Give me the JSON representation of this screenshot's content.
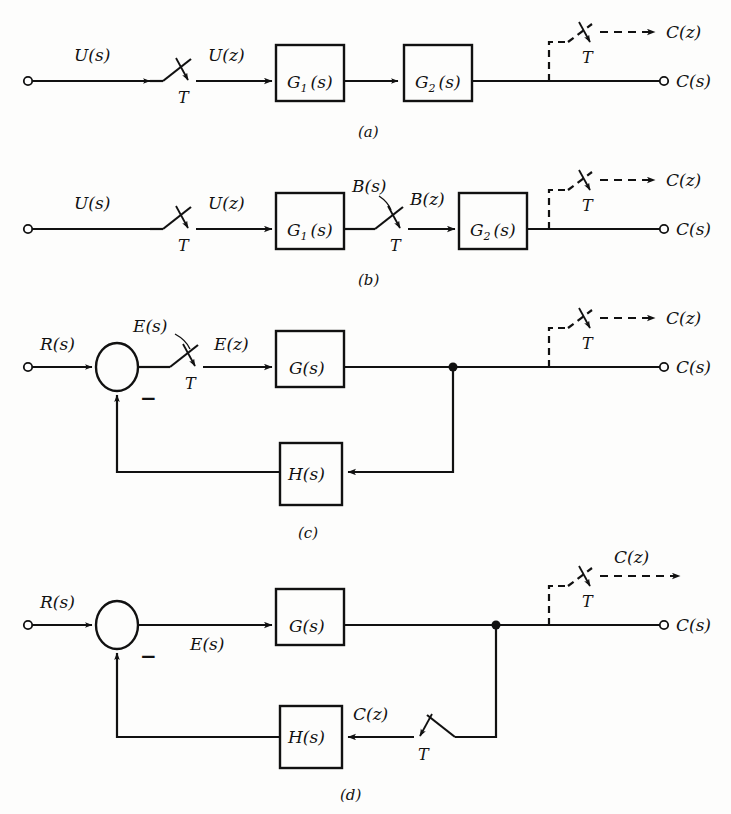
{
  "figure": {
    "type": "control-system-block-diagram",
    "line_color": "#111111",
    "background_color": "#fdfdfc"
  },
  "diagrams": [
    {
      "caption": "(a)",
      "input_label": "U(s)",
      "sampler_label": "T",
      "sampled_label": "U(z)",
      "blocks": [
        {
          "name": "G1",
          "text_main": "G",
          "subscript": "1",
          "text_arg": "(s)"
        },
        {
          "name": "G2",
          "text_main": "G",
          "subscript": "2",
          "text_arg": "(s)"
        }
      ],
      "output_sampler_label": "T",
      "output_discrete": "C(z)",
      "output_continuous": "C(s)"
    },
    {
      "caption": "(b)",
      "input_label": "U(s)",
      "sampler_label": "T",
      "sampled_label": "U(z)",
      "inter_label_before": "B(s)",
      "inter_sampler_label": "T",
      "inter_label_after": "B(z)",
      "blocks": [
        {
          "name": "G1",
          "text_main": "G",
          "subscript": "1",
          "text_arg": "(s)"
        },
        {
          "name": "G2",
          "text_main": "G",
          "subscript": "2",
          "text_arg": "(s)"
        }
      ],
      "output_sampler_label": "T",
      "output_discrete": "C(z)",
      "output_continuous": "C(s)"
    },
    {
      "caption": "(c)",
      "input_label": "R(s)",
      "summer_sign": "−",
      "error_label": "E(s)",
      "sampler_label": "T",
      "sampled_error_label": "E(z)",
      "forward_block": "G(s)",
      "feedback_block": "H(s)",
      "output_sampler_label": "T",
      "output_discrete": "C(z)",
      "output_continuous": "C(s)"
    },
    {
      "caption": "(d)",
      "input_label": "R(s)",
      "summer_sign": "−",
      "error_label": "E(s)",
      "forward_block": "G(s)",
      "feedback_block": "H(s)",
      "feedback_sampler_label": "T",
      "feedback_sampled_label": "C(z)",
      "output_sampler_label": "T",
      "output_discrete": "C(z)",
      "output_continuous": "C(s)"
    }
  ]
}
